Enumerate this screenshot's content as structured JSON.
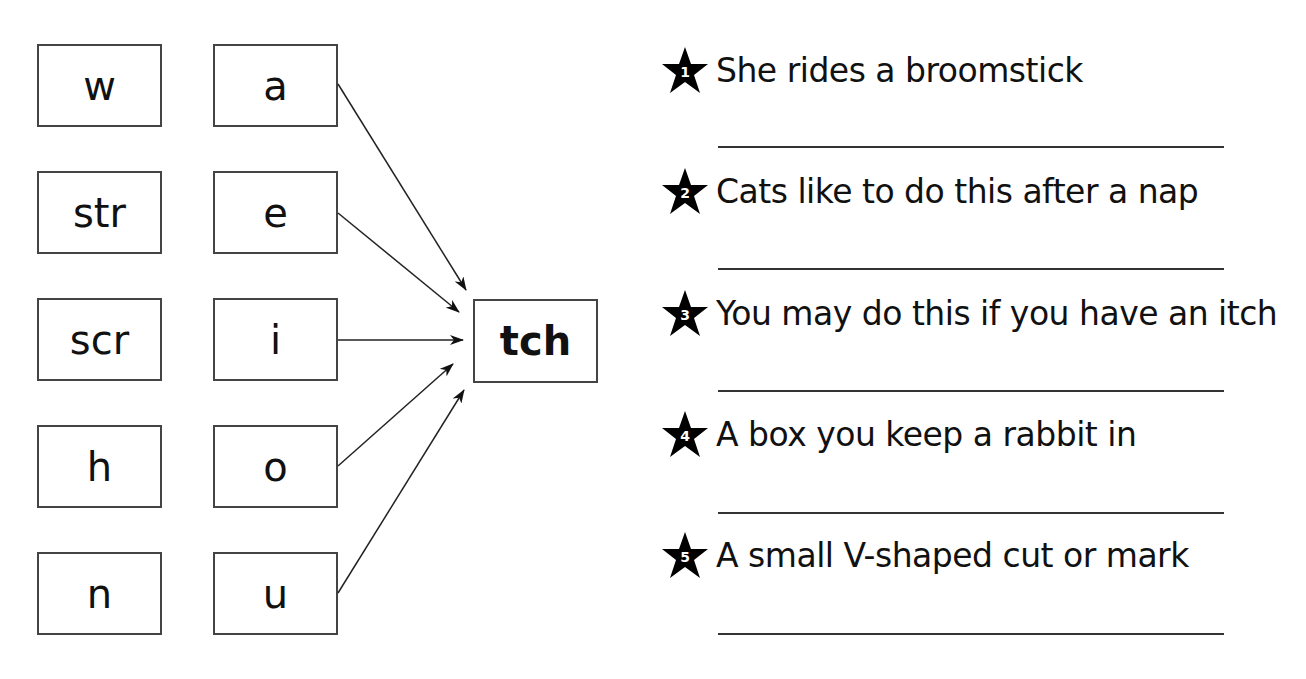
{
  "left_column": [
    "w",
    "str",
    "scr",
    "h",
    "n"
  ],
  "vowel_column": [
    "a",
    "e",
    "i",
    "o",
    "u"
  ],
  "ending": "tch",
  "clues": [
    {
      "number": "1",
      "text": "She rides a broomstick",
      "answer": ""
    },
    {
      "number": "2",
      "text": "Cats like to do this after a nap",
      "answer": ""
    },
    {
      "number": "3",
      "text": "You may do this if you have an itch",
      "answer": ""
    },
    {
      "number": "4",
      "text": "A box you keep a rabbit in",
      "answer": ""
    },
    {
      "number": "5",
      "text": "A small V-shaped cut or mark",
      "answer": ""
    }
  ],
  "icons": {
    "clue_marker": "star-icon",
    "connector": "arrow-icon"
  }
}
